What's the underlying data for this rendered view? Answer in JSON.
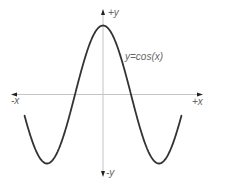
{
  "chart_data": {
    "type": "line",
    "title": "",
    "function": "y=cos(x)",
    "annotation": "y=cos(x)",
    "xlabel_pos": "+x",
    "xlabel_neg": "-x",
    "ylabel_pos": "+y",
    "ylabel_neg": "-y",
    "grid": false,
    "legend": null,
    "x_range_radians": [
      -4.4,
      4.4
    ],
    "y_range": [
      -1,
      1
    ],
    "series": [
      {
        "name": "y=cos(x)",
        "x": [
          -4.4,
          -3.1416,
          -1.5708,
          0,
          1.5708,
          3.1416,
          4.4
        ],
        "values": [
          -0.31,
          -1,
          0,
          1,
          0,
          -1,
          -0.31
        ]
      }
    ],
    "colors": {
      "curve": "#333333",
      "axis": "#bbbbbb",
      "arrow": "#222222",
      "text": "#666666"
    }
  }
}
